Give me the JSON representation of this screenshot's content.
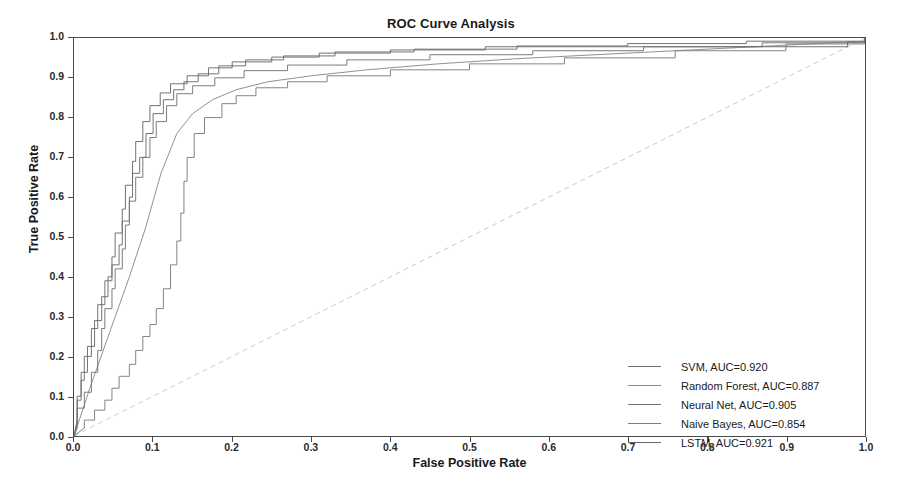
{
  "chart_data": {
    "type": "line",
    "title": "ROC Curve Analysis",
    "xlabel": "False Positive Rate",
    "ylabel": "True Positive Rate",
    "xlim": [
      0.0,
      1.0
    ],
    "ylim": [
      0.0,
      1.0
    ],
    "xticks": [
      "0.0",
      "0.1",
      "0.2",
      "0.3",
      "0.4",
      "0.5",
      "0.6",
      "0.7",
      "0.8",
      "0.9",
      "1.0"
    ],
    "yticks": [
      "0.0",
      "0.1",
      "0.2",
      "0.3",
      "0.4",
      "0.5",
      "0.6",
      "0.7",
      "0.8",
      "0.9",
      "1.0"
    ],
    "grid": false,
    "legend_position": "lower-right",
    "reference_line": {
      "name": "chance-diagonal",
      "style": "dashed",
      "color": "#c8c8c8",
      "points": [
        [
          0.0,
          0.0
        ],
        [
          1.0,
          1.0
        ]
      ]
    },
    "series": [
      {
        "name": "SVM",
        "auc": "0.920",
        "legend_label": "SVM, AUC=0.920",
        "color": "#6e6e6e",
        "style": "step",
        "points": [
          [
            0.0,
            0.0
          ],
          [
            0.004,
            0.03
          ],
          [
            0.004,
            0.09
          ],
          [
            0.009,
            0.09
          ],
          [
            0.009,
            0.14
          ],
          [
            0.013,
            0.14
          ],
          [
            0.013,
            0.2
          ],
          [
            0.022,
            0.2
          ],
          [
            0.022,
            0.27
          ],
          [
            0.03,
            0.27
          ],
          [
            0.03,
            0.33
          ],
          [
            0.039,
            0.33
          ],
          [
            0.039,
            0.39
          ],
          [
            0.048,
            0.39
          ],
          [
            0.048,
            0.43
          ],
          [
            0.057,
            0.43
          ],
          [
            0.057,
            0.48
          ],
          [
            0.061,
            0.48
          ],
          [
            0.061,
            0.54
          ],
          [
            0.07,
            0.54
          ],
          [
            0.07,
            0.6
          ],
          [
            0.074,
            0.6
          ],
          [
            0.074,
            0.66
          ],
          [
            0.083,
            0.66
          ],
          [
            0.083,
            0.7
          ],
          [
            0.091,
            0.7
          ],
          [
            0.091,
            0.76
          ],
          [
            0.1,
            0.76
          ],
          [
            0.1,
            0.81
          ],
          [
            0.113,
            0.81
          ],
          [
            0.113,
            0.845
          ],
          [
            0.126,
            0.845
          ],
          [
            0.126,
            0.87
          ],
          [
            0.139,
            0.87
          ],
          [
            0.139,
            0.89
          ],
          [
            0.157,
            0.89
          ],
          [
            0.157,
            0.91
          ],
          [
            0.183,
            0.91
          ],
          [
            0.183,
            0.93
          ],
          [
            0.217,
            0.93
          ],
          [
            0.217,
            0.945
          ],
          [
            0.265,
            0.945
          ],
          [
            0.265,
            0.955
          ],
          [
            0.33,
            0.955
          ],
          [
            0.33,
            0.965
          ],
          [
            0.43,
            0.965
          ],
          [
            0.43,
            0.972
          ],
          [
            0.56,
            0.972
          ],
          [
            0.56,
            0.98
          ],
          [
            0.7,
            0.98
          ],
          [
            0.7,
            0.986
          ],
          [
            0.85,
            0.986
          ],
          [
            0.85,
            0.992
          ],
          [
            1.0,
            0.992
          ],
          [
            1.0,
            1.0
          ]
        ]
      },
      {
        "name": "Random Forest",
        "auc": "0.887",
        "legend_label": "Random Forest, AUC=0.887",
        "color": "#8a8a8a",
        "style": "smooth",
        "points": [
          [
            0.0,
            0.0
          ],
          [
            0.02,
            0.12
          ],
          [
            0.045,
            0.26
          ],
          [
            0.07,
            0.4
          ],
          [
            0.09,
            0.52
          ],
          [
            0.11,
            0.66
          ],
          [
            0.13,
            0.76
          ],
          [
            0.15,
            0.81
          ],
          [
            0.175,
            0.845
          ],
          [
            0.205,
            0.87
          ],
          [
            0.245,
            0.89
          ],
          [
            0.3,
            0.905
          ],
          [
            0.37,
            0.92
          ],
          [
            0.46,
            0.935
          ],
          [
            0.56,
            0.948
          ],
          [
            0.68,
            0.96
          ],
          [
            0.8,
            0.972
          ],
          [
            0.9,
            0.982
          ],
          [
            1.0,
            0.992
          ],
          [
            1.0,
            1.0
          ]
        ]
      },
      {
        "name": "Neural Net",
        "auc": "0.905",
        "legend_label": "Neural Net, AUC=0.905",
        "color": "#757575",
        "style": "step",
        "points": [
          [
            0.0,
            0.0
          ],
          [
            0.004,
            0.02
          ],
          [
            0.004,
            0.07
          ],
          [
            0.013,
            0.07
          ],
          [
            0.013,
            0.11
          ],
          [
            0.022,
            0.11
          ],
          [
            0.022,
            0.16
          ],
          [
            0.03,
            0.16
          ],
          [
            0.03,
            0.215
          ],
          [
            0.035,
            0.215
          ],
          [
            0.035,
            0.27
          ],
          [
            0.039,
            0.27
          ],
          [
            0.039,
            0.32
          ],
          [
            0.048,
            0.32
          ],
          [
            0.048,
            0.37
          ],
          [
            0.052,
            0.37
          ],
          [
            0.052,
            0.42
          ],
          [
            0.061,
            0.42
          ],
          [
            0.061,
            0.47
          ],
          [
            0.065,
            0.47
          ],
          [
            0.065,
            0.53
          ],
          [
            0.07,
            0.53
          ],
          [
            0.07,
            0.59
          ],
          [
            0.078,
            0.59
          ],
          [
            0.078,
            0.65
          ],
          [
            0.087,
            0.65
          ],
          [
            0.087,
            0.7
          ],
          [
            0.096,
            0.7
          ],
          [
            0.096,
            0.75
          ],
          [
            0.104,
            0.75
          ],
          [
            0.104,
            0.79
          ],
          [
            0.117,
            0.79
          ],
          [
            0.117,
            0.83
          ],
          [
            0.13,
            0.83
          ],
          [
            0.13,
            0.86
          ],
          [
            0.15,
            0.86
          ],
          [
            0.15,
            0.88
          ],
          [
            0.178,
            0.88
          ],
          [
            0.178,
            0.9
          ],
          [
            0.215,
            0.9
          ],
          [
            0.215,
            0.918
          ],
          [
            0.27,
            0.918
          ],
          [
            0.27,
            0.932
          ],
          [
            0.345,
            0.932
          ],
          [
            0.345,
            0.945
          ],
          [
            0.45,
            0.945
          ],
          [
            0.45,
            0.958
          ],
          [
            0.58,
            0.958
          ],
          [
            0.58,
            0.968
          ],
          [
            0.72,
            0.968
          ],
          [
            0.72,
            0.978
          ],
          [
            0.87,
            0.978
          ],
          [
            0.87,
            0.988
          ],
          [
            1.0,
            0.988
          ],
          [
            1.0,
            1.0
          ]
        ]
      },
      {
        "name": "Naive Bayes",
        "auc": "0.854",
        "legend_label": "Naive Bayes, AUC=0.854",
        "color": "#7d7d7d",
        "style": "step",
        "points": [
          [
            0.0,
            0.0
          ],
          [
            0.013,
            0.02
          ],
          [
            0.013,
            0.04
          ],
          [
            0.026,
            0.04
          ],
          [
            0.026,
            0.065
          ],
          [
            0.039,
            0.065
          ],
          [
            0.039,
            0.09
          ],
          [
            0.048,
            0.09
          ],
          [
            0.048,
            0.12
          ],
          [
            0.057,
            0.12
          ],
          [
            0.057,
            0.15
          ],
          [
            0.07,
            0.15
          ],
          [
            0.07,
            0.18
          ],
          [
            0.078,
            0.18
          ],
          [
            0.078,
            0.215
          ],
          [
            0.087,
            0.215
          ],
          [
            0.087,
            0.25
          ],
          [
            0.096,
            0.25
          ],
          [
            0.096,
            0.28
          ],
          [
            0.104,
            0.28
          ],
          [
            0.104,
            0.32
          ],
          [
            0.113,
            0.32
          ],
          [
            0.113,
            0.37
          ],
          [
            0.122,
            0.37
          ],
          [
            0.122,
            0.43
          ],
          [
            0.13,
            0.43
          ],
          [
            0.13,
            0.49
          ],
          [
            0.135,
            0.49
          ],
          [
            0.135,
            0.56
          ],
          [
            0.139,
            0.56
          ],
          [
            0.139,
            0.64
          ],
          [
            0.143,
            0.64
          ],
          [
            0.143,
            0.7
          ],
          [
            0.152,
            0.7
          ],
          [
            0.152,
            0.76
          ],
          [
            0.165,
            0.76
          ],
          [
            0.165,
            0.8
          ],
          [
            0.187,
            0.8
          ],
          [
            0.187,
            0.835
          ],
          [
            0.205,
            0.835
          ],
          [
            0.205,
            0.855
          ],
          [
            0.23,
            0.855
          ],
          [
            0.23,
            0.875
          ],
          [
            0.27,
            0.875
          ],
          [
            0.27,
            0.89
          ],
          [
            0.32,
            0.89
          ],
          [
            0.32,
            0.905
          ],
          [
            0.4,
            0.905
          ],
          [
            0.4,
            0.92
          ],
          [
            0.5,
            0.92
          ],
          [
            0.5,
            0.935
          ],
          [
            0.62,
            0.935
          ],
          [
            0.62,
            0.95
          ],
          [
            0.76,
            0.95
          ],
          [
            0.76,
            0.968
          ],
          [
            0.9,
            0.968
          ],
          [
            0.9,
            0.985
          ],
          [
            1.0,
            0.985
          ],
          [
            1.0,
            1.0
          ]
        ]
      },
      {
        "name": "LSTM",
        "auc": "0.921",
        "legend_label": "LSTM, AUC=0.921",
        "color": "#6a6a6a",
        "style": "step",
        "points": [
          [
            0.0,
            0.0
          ],
          [
            0.004,
            0.04
          ],
          [
            0.004,
            0.1
          ],
          [
            0.009,
            0.1
          ],
          [
            0.009,
            0.16
          ],
          [
            0.017,
            0.16
          ],
          [
            0.017,
            0.225
          ],
          [
            0.026,
            0.225
          ],
          [
            0.026,
            0.29
          ],
          [
            0.035,
            0.29
          ],
          [
            0.035,
            0.35
          ],
          [
            0.043,
            0.35
          ],
          [
            0.043,
            0.4
          ],
          [
            0.048,
            0.4
          ],
          [
            0.048,
            0.45
          ],
          [
            0.052,
            0.45
          ],
          [
            0.052,
            0.51
          ],
          [
            0.061,
            0.51
          ],
          [
            0.061,
            0.57
          ],
          [
            0.065,
            0.57
          ],
          [
            0.065,
            0.63
          ],
          [
            0.074,
            0.63
          ],
          [
            0.074,
            0.69
          ],
          [
            0.078,
            0.69
          ],
          [
            0.078,
            0.74
          ],
          [
            0.087,
            0.74
          ],
          [
            0.087,
            0.79
          ],
          [
            0.096,
            0.79
          ],
          [
            0.096,
            0.83
          ],
          [
            0.109,
            0.83
          ],
          [
            0.109,
            0.862
          ],
          [
            0.122,
            0.862
          ],
          [
            0.122,
            0.885
          ],
          [
            0.143,
            0.885
          ],
          [
            0.143,
            0.905
          ],
          [
            0.17,
            0.905
          ],
          [
            0.17,
            0.925
          ],
          [
            0.2,
            0.925
          ],
          [
            0.2,
            0.94
          ],
          [
            0.25,
            0.94
          ],
          [
            0.25,
            0.952
          ],
          [
            0.31,
            0.952
          ],
          [
            0.31,
            0.962
          ],
          [
            0.4,
            0.962
          ],
          [
            0.4,
            0.97
          ],
          [
            0.52,
            0.97
          ],
          [
            0.52,
            0.978
          ],
          [
            0.66,
            0.978
          ],
          [
            0.978,
            0.978
          ],
          [
            0.978,
            0.99
          ],
          [
            1.0,
            0.99
          ],
          [
            1.0,
            1.0
          ]
        ]
      }
    ]
  },
  "figure": {
    "background_color": "#ffffff",
    "frame_color": "#4a4a4a"
  }
}
